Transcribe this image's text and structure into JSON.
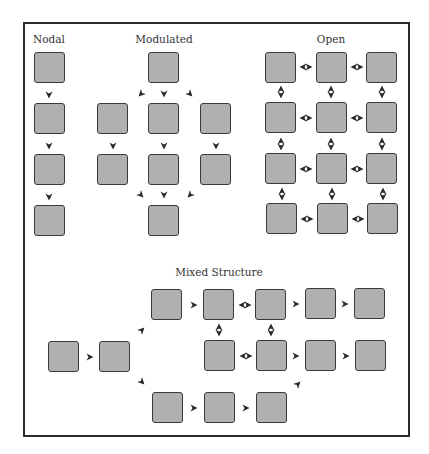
{
  "diagram": {
    "colors": {
      "node_fill": "#b0b0b0",
      "node_border": "#3a3a3a",
      "frame": "#2a2a2a",
      "arrow": "#2a2a2a"
    },
    "sections": [
      {
        "id": "nodal",
        "title": "Nodal",
        "title_pos": [
          49,
          40
        ]
      },
      {
        "id": "modulated",
        "title": "Modulated",
        "title_pos": [
          164,
          40
        ]
      },
      {
        "id": "open",
        "title": "Open",
        "title_pos": [
          331,
          40
        ]
      },
      {
        "id": "mixed",
        "title": "Mixed Structure",
        "title_pos": [
          219,
          274
        ]
      }
    ],
    "nodes": [
      {
        "s": "nodal",
        "x": 34,
        "y": 52
      },
      {
        "s": "nodal",
        "x": 34,
        "y": 103
      },
      {
        "s": "nodal",
        "x": 34,
        "y": 154
      },
      {
        "s": "nodal",
        "x": 34,
        "y": 205
      },
      {
        "s": "modulated",
        "x": 148,
        "y": 52
      },
      {
        "s": "modulated",
        "x": 97,
        "y": 103
      },
      {
        "s": "modulated",
        "x": 148,
        "y": 103
      },
      {
        "s": "modulated",
        "x": 200,
        "y": 103
      },
      {
        "s": "modulated",
        "x": 97,
        "y": 154
      },
      {
        "s": "modulated",
        "x": 148,
        "y": 154
      },
      {
        "s": "modulated",
        "x": 200,
        "y": 154
      },
      {
        "s": "modulated",
        "x": 148,
        "y": 205
      },
      {
        "s": "open",
        "x": 265,
        "y": 52
      },
      {
        "s": "open",
        "x": 316,
        "y": 52
      },
      {
        "s": "open",
        "x": 366,
        "y": 52
      },
      {
        "s": "open",
        "x": 265,
        "y": 102
      },
      {
        "s": "open",
        "x": 316,
        "y": 102
      },
      {
        "s": "open",
        "x": 366,
        "y": 102
      },
      {
        "s": "open",
        "x": 265,
        "y": 153
      },
      {
        "s": "open",
        "x": 316,
        "y": 153
      },
      {
        "s": "open",
        "x": 366,
        "y": 153
      },
      {
        "s": "open",
        "x": 266,
        "y": 203
      },
      {
        "s": "open",
        "x": 317,
        "y": 203
      },
      {
        "s": "open",
        "x": 367,
        "y": 203
      },
      {
        "s": "mixed",
        "x": 151,
        "y": 289
      },
      {
        "s": "mixed",
        "x": 203,
        "y": 289
      },
      {
        "s": "mixed",
        "x": 255,
        "y": 289
      },
      {
        "s": "mixed",
        "x": 305,
        "y": 288
      },
      {
        "s": "mixed",
        "x": 354,
        "y": 288
      },
      {
        "s": "mixed",
        "x": 48,
        "y": 341
      },
      {
        "s": "mixed",
        "x": 99,
        "y": 341
      },
      {
        "s": "mixed",
        "x": 204,
        "y": 340
      },
      {
        "s": "mixed",
        "x": 256,
        "y": 340
      },
      {
        "s": "mixed",
        "x": 305,
        "y": 340
      },
      {
        "s": "mixed",
        "x": 355,
        "y": 340
      },
      {
        "s": "mixed",
        "x": 152,
        "y": 392
      },
      {
        "s": "mixed",
        "x": 204,
        "y": 392
      },
      {
        "s": "mixed",
        "x": 256,
        "y": 392
      }
    ],
    "arrows": [
      {
        "t": "down",
        "x": 49,
        "y": 95
      },
      {
        "t": "down",
        "x": 49,
        "y": 146
      },
      {
        "t": "down",
        "x": 49,
        "y": 197
      },
      {
        "t": "downleft",
        "x": 141,
        "y": 94
      },
      {
        "t": "down",
        "x": 164,
        "y": 94
      },
      {
        "t": "downright",
        "x": 190,
        "y": 94
      },
      {
        "t": "down",
        "x": 113,
        "y": 146
      },
      {
        "t": "down",
        "x": 164,
        "y": 146
      },
      {
        "t": "down",
        "x": 216,
        "y": 146
      },
      {
        "t": "downright",
        "x": 141,
        "y": 195
      },
      {
        "t": "down",
        "x": 164,
        "y": 195
      },
      {
        "t": "downleft",
        "x": 190,
        "y": 195
      },
      {
        "t": "hbi",
        "x": 306,
        "y": 67
      },
      {
        "t": "hbi",
        "x": 357,
        "y": 67
      },
      {
        "t": "hbi",
        "x": 306,
        "y": 118
      },
      {
        "t": "hbi",
        "x": 357,
        "y": 118
      },
      {
        "t": "hbi",
        "x": 306,
        "y": 169
      },
      {
        "t": "hbi",
        "x": 357,
        "y": 169
      },
      {
        "t": "hbi",
        "x": 307,
        "y": 219
      },
      {
        "t": "hbi",
        "x": 358,
        "y": 219
      },
      {
        "t": "vbi",
        "x": 281,
        "y": 92
      },
      {
        "t": "vbi",
        "x": 331,
        "y": 92
      },
      {
        "t": "vbi",
        "x": 382,
        "y": 92
      },
      {
        "t": "vbi",
        "x": 281,
        "y": 144
      },
      {
        "t": "vbi",
        "x": 331,
        "y": 144
      },
      {
        "t": "vbi",
        "x": 382,
        "y": 144
      },
      {
        "t": "vbi",
        "x": 282,
        "y": 194
      },
      {
        "t": "vbi",
        "x": 332,
        "y": 194
      },
      {
        "t": "vbi",
        "x": 383,
        "y": 194
      },
      {
        "t": "right",
        "x": 90,
        "y": 357
      },
      {
        "t": "upright",
        "x": 142,
        "y": 330
      },
      {
        "t": "downright2",
        "x": 142,
        "y": 382
      },
      {
        "t": "right",
        "x": 194,
        "y": 305
      },
      {
        "t": "hbi",
        "x": 245,
        "y": 305
      },
      {
        "t": "right",
        "x": 296,
        "y": 304
      },
      {
        "t": "right",
        "x": 345,
        "y": 304
      },
      {
        "t": "vbi",
        "x": 219,
        "y": 330
      },
      {
        "t": "vbi",
        "x": 271,
        "y": 330
      },
      {
        "t": "hbi",
        "x": 246,
        "y": 356
      },
      {
        "t": "right",
        "x": 296,
        "y": 356
      },
      {
        "t": "right",
        "x": 346,
        "y": 356
      },
      {
        "t": "right",
        "x": 194,
        "y": 408
      },
      {
        "t": "right",
        "x": 246,
        "y": 408
      },
      {
        "t": "upright",
        "x": 298,
        "y": 384
      }
    ]
  }
}
